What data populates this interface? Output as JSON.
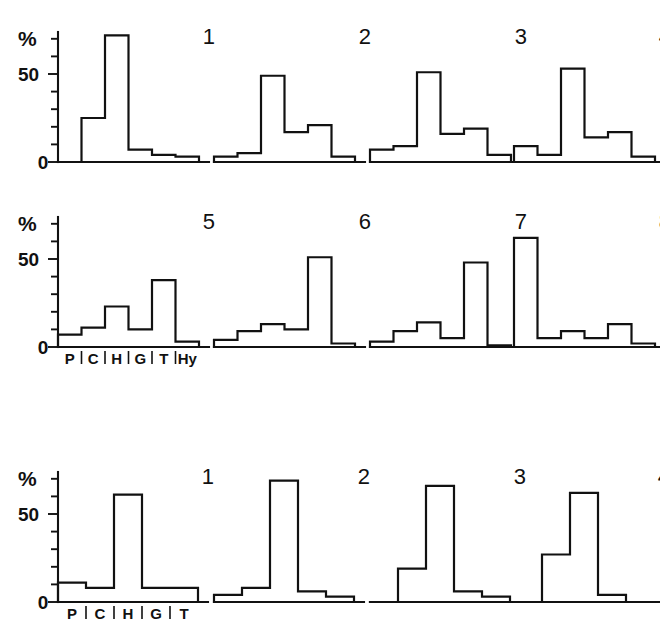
{
  "figure": {
    "cut_caption": "",
    "y_axis_label": "%",
    "y_ticks_labeled": [
      "50",
      "0"
    ],
    "y_tick_values": [
      0,
      10,
      20,
      30,
      40,
      50,
      60,
      70
    ],
    "y_min": 0,
    "y_max": 75,
    "line_color": "#111111",
    "background_color": "#ffffff"
  },
  "chart_data": [
    {
      "type": "bar",
      "title": "1",
      "group": "upper",
      "categories": [
        "P",
        "C",
        "H",
        "G",
        "T",
        "Hy"
      ],
      "values": [
        0,
        25,
        72,
        7,
        4,
        3
      ],
      "xlabel": "",
      "ylabel": "%",
      "ylim": [
        0,
        75
      ],
      "grid": false,
      "legend": "none"
    },
    {
      "type": "bar",
      "title": "2",
      "group": "upper",
      "categories": [
        "P",
        "C",
        "H",
        "G",
        "T",
        "Hy"
      ],
      "values": [
        3,
        5,
        49,
        17,
        21,
        3
      ],
      "xlabel": "",
      "ylabel": "%",
      "ylim": [
        0,
        75
      ],
      "grid": false,
      "legend": "none"
    },
    {
      "type": "bar",
      "title": "3",
      "group": "upper",
      "categories": [
        "P",
        "C",
        "H",
        "G",
        "T",
        "Hy"
      ],
      "values": [
        7,
        9,
        51,
        16,
        19,
        4
      ],
      "xlabel": "",
      "ylabel": "%",
      "ylim": [
        0,
        75
      ],
      "grid": false,
      "legend": "none"
    },
    {
      "type": "bar",
      "title": "4",
      "group": "upper",
      "categories": [
        "P",
        "C",
        "H",
        "G",
        "T",
        "Hy"
      ],
      "values": [
        9,
        4,
        53,
        14,
        17,
        3
      ],
      "xlabel": "",
      "ylabel": "%",
      "ylim": [
        0,
        75
      ],
      "grid": false,
      "legend": "none"
    },
    {
      "type": "bar",
      "title": "5",
      "group": "middle",
      "categories": [
        "P",
        "C",
        "H",
        "G",
        "T",
        "Hy"
      ],
      "values": [
        7,
        11,
        23,
        10,
        38,
        3
      ],
      "xlabel": "",
      "ylabel": "%",
      "ylim": [
        0,
        75
      ],
      "grid": false,
      "legend": "none"
    },
    {
      "type": "bar",
      "title": "6",
      "group": "middle",
      "categories": [
        "P",
        "C",
        "H",
        "G",
        "T",
        "Hy"
      ],
      "values": [
        4,
        9,
        13,
        10,
        51,
        2
      ],
      "xlabel": "",
      "ylabel": "%",
      "ylim": [
        0,
        75
      ],
      "grid": false,
      "legend": "none"
    },
    {
      "type": "bar",
      "title": "7",
      "group": "middle",
      "categories": [
        "P",
        "C",
        "H",
        "G",
        "T",
        "Hy"
      ],
      "values": [
        3,
        9,
        14,
        5,
        48,
        1
      ],
      "xlabel": "",
      "ylabel": "%",
      "ylim": [
        0,
        75
      ],
      "grid": false,
      "legend": "none"
    },
    {
      "type": "bar",
      "title": "8",
      "group": "middle",
      "categories": [
        "P",
        "C",
        "H",
        "G",
        "T",
        "Hy"
      ],
      "values": [
        62,
        5,
        9,
        5,
        13,
        2
      ],
      "xlabel": "",
      "ylabel": "%",
      "ylim": [
        0,
        75
      ],
      "grid": false,
      "legend": "none"
    },
    {
      "type": "bar",
      "title": "1",
      "group": "lower",
      "categories": [
        "P",
        "C",
        "H",
        "G",
        "T"
      ],
      "values": [
        11,
        8,
        61,
        8,
        8
      ],
      "xlabel": "",
      "ylabel": "%",
      "ylim": [
        0,
        75
      ],
      "grid": false,
      "legend": "none"
    },
    {
      "type": "bar",
      "title": "2",
      "group": "lower",
      "categories": [
        "P",
        "C",
        "H",
        "G",
        "T"
      ],
      "values": [
        4,
        8,
        69,
        6,
        3
      ],
      "xlabel": "",
      "ylabel": "%",
      "ylim": [
        0,
        75
      ],
      "grid": false,
      "legend": "none"
    },
    {
      "type": "bar",
      "title": "3",
      "group": "lower",
      "categories": [
        "P",
        "C",
        "H",
        "G",
        "T"
      ],
      "values": [
        0,
        19,
        66,
        6,
        3
      ],
      "xlabel": "",
      "ylabel": "%",
      "ylim": [
        0,
        75
      ],
      "grid": false,
      "legend": "none"
    },
    {
      "type": "bar",
      "title": "4",
      "group": "lower",
      "categories": [
        "P",
        "C",
        "H",
        "G",
        "T"
      ],
      "values": [
        0,
        27,
        62,
        4,
        0
      ],
      "xlabel": "",
      "ylabel": "%",
      "ylim": [
        0,
        75
      ],
      "grid": false,
      "legend": "none"
    }
  ],
  "layout": {
    "rows": [
      {
        "name": "upper",
        "panel_indices": [
          0,
          1,
          2,
          3
        ],
        "has_y_axis": true,
        "has_x_labels": false
      },
      {
        "name": "middle",
        "panel_indices": [
          4,
          5,
          6,
          7
        ],
        "has_y_axis": true,
        "has_x_labels": true
      },
      {
        "name": "lower",
        "panel_indices": [
          8,
          9,
          10,
          11
        ],
        "has_y_axis": true,
        "has_x_labels": true
      }
    ],
    "panel_x_offsets": [
      14,
      170,
      326,
      470
    ],
    "panel_width": 150,
    "panel_height": 150
  }
}
